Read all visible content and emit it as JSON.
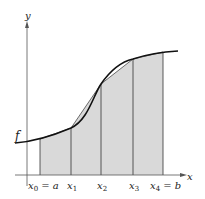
{
  "figure": {
    "axis_labels": {
      "x": "x",
      "y": "y"
    },
    "function_label": "f",
    "partition_labels": [
      {
        "main": "x",
        "sub": "0",
        "suffix": " = a"
      },
      {
        "main": "x",
        "sub": "1",
        "suffix": ""
      },
      {
        "main": "x",
        "sub": "2",
        "suffix": ""
      },
      {
        "main": "x",
        "sub": "3",
        "suffix": ""
      },
      {
        "main": "x",
        "sub": "4",
        "suffix": " = b"
      }
    ],
    "colors": {
      "shade": "#d9d9d9",
      "curve": "#111111",
      "axis": "#555555"
    }
  }
}
